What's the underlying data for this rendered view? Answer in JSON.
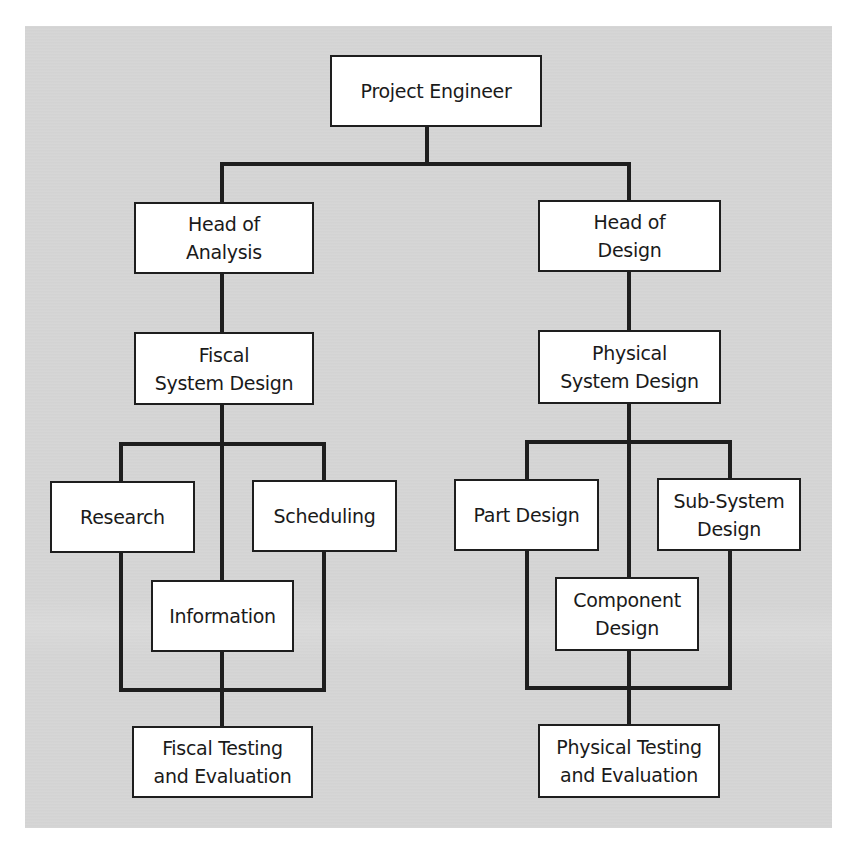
{
  "diagram": {
    "type": "organization-chart",
    "colors": {
      "panel_background": "#d6d6d6",
      "box_fill": "#ffffff",
      "line_color": "#1e1e1e",
      "text_color": "#1a1a1a"
    },
    "nodes": {
      "project_engineer": "Project Engineer",
      "head_of_analysis": "Head of\nAnalysis",
      "head_of_design": "Head of\nDesign",
      "fiscal_system_design": "Fiscal\nSystem Design",
      "physical_system_design": "Physical\nSystem Design",
      "research": "Research",
      "scheduling": "Scheduling",
      "information": "Information",
      "part_design": "Part Design",
      "sub_system_design": "Sub-System\nDesign",
      "component_design": "Component\nDesign",
      "fiscal_testing": "Fiscal Testing\nand Evaluation",
      "physical_testing": "Physical Testing\nand Evaluation"
    },
    "edges": [
      [
        "Project Engineer",
        "Head of Analysis"
      ],
      [
        "Project Engineer",
        "Head of Design"
      ],
      [
        "Head of Analysis",
        "Fiscal System Design"
      ],
      [
        "Head of Design",
        "Physical System Design"
      ],
      [
        "Fiscal System Design",
        "Research"
      ],
      [
        "Fiscal System Design",
        "Scheduling"
      ],
      [
        "Fiscal System Design",
        "Information"
      ],
      [
        "Research",
        "Fiscal Testing and Evaluation"
      ],
      [
        "Scheduling",
        "Fiscal Testing and Evaluation"
      ],
      [
        "Information",
        "Fiscal Testing and Evaluation"
      ],
      [
        "Physical System Design",
        "Part Design"
      ],
      [
        "Physical System Design",
        "Sub-System Design"
      ],
      [
        "Physical System Design",
        "Component Design"
      ],
      [
        "Part Design",
        "Physical Testing and Evaluation"
      ],
      [
        "Sub-System Design",
        "Physical Testing and Evaluation"
      ],
      [
        "Component Design",
        "Physical Testing and Evaluation"
      ]
    ]
  }
}
